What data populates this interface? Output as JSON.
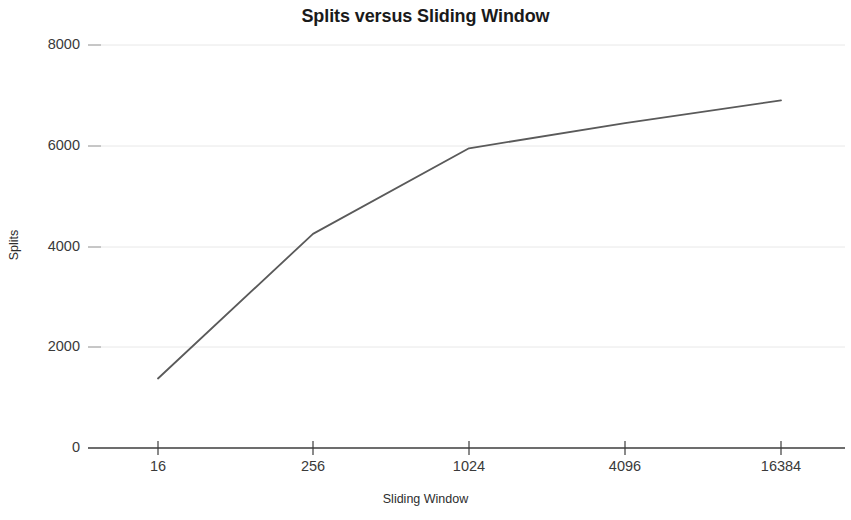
{
  "chart_data": {
    "type": "line",
    "title": "Splits versus Sliding Window",
    "xlabel": "Sliding Window",
    "ylabel": "Splits",
    "x_tick_labels": [
      "16",
      "256",
      "1024",
      "4096",
      "16384"
    ],
    "x_values": [
      16,
      256,
      1024,
      4096,
      16384
    ],
    "y_tick_labels": [
      "0",
      "2000",
      "4000",
      "6000",
      "8000"
    ],
    "y_ticks": [
      0,
      2000,
      4000,
      6000,
      8000
    ],
    "ylim": [
      0,
      8000
    ],
    "grid": true,
    "legend": false,
    "series": [
      {
        "name": "Splits",
        "values": [
          1380,
          4250,
          5950,
          6450,
          6900
        ],
        "color": "#5a5a5a",
        "marker": "none"
      }
    ]
  },
  "axes": {
    "axis_color": "#3c3c3c",
    "grid_color": "#e8e8e8",
    "tick_color": "#3c3c3c"
  }
}
